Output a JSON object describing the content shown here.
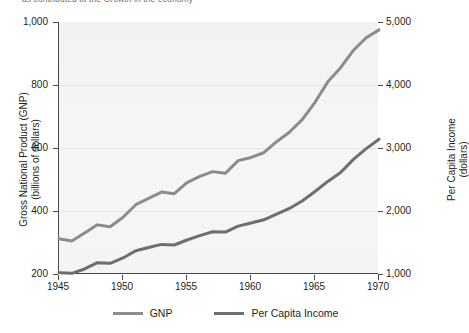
{
  "caption": {
    "text": "as contributed to the Growth in the economy"
  },
  "chart_data": {
    "type": "line",
    "title": "",
    "subtitle": "",
    "xlabel": "",
    "ylabel": "Gross National Product (GNP)\n(billions of dollars)",
    "y2label": "Per Capita Income\n(dollars)",
    "grid": true,
    "legend_position": "bottom",
    "x": [
      1945,
      1946,
      1947,
      1948,
      1949,
      1950,
      1951,
      1952,
      1953,
      1954,
      1955,
      1956,
      1957,
      1958,
      1959,
      1960,
      1961,
      1962,
      1963,
      1964,
      1965,
      1966,
      1967,
      1968,
      1969,
      1970
    ],
    "xlim": [
      1945,
      1970
    ],
    "xticks": [
      1945,
      1950,
      1955,
      1960,
      1965,
      1970
    ],
    "xtick_labels": [
      "1945",
      "1950",
      "1955",
      "1960",
      "1965",
      "1970"
    ],
    "ylim": [
      200,
      1000
    ],
    "yticks": [
      200,
      400,
      600,
      800,
      1000
    ],
    "ytick_labels": [
      "200",
      "400",
      "600",
      "800",
      "1,000"
    ],
    "y2lim": [
      1000,
      5000
    ],
    "y2ticks": [
      1000,
      2000,
      3000,
      4000,
      5000
    ],
    "y2tick_labels": [
      "1,000",
      "2,000",
      "3,000",
      "4,000",
      "5,000"
    ],
    "series": [
      {
        "name": "GNP",
        "axis": "left",
        "color": "#8c8c8c",
        "units": "billions of dollars",
        "values": [
          312,
          305,
          330,
          356,
          350,
          380,
          420,
          440,
          460,
          455,
          490,
          510,
          525,
          520,
          560,
          570,
          585,
          620,
          650,
          690,
          745,
          810,
          855,
          910,
          950,
          975
        ]
      },
      {
        "name": "Per Capita Income",
        "axis": "right",
        "color": "#6e6e6e",
        "units": "dollars",
        "values": [
          1020,
          1010,
          1080,
          1180,
          1170,
          1255,
          1370,
          1420,
          1470,
          1460,
          1540,
          1610,
          1670,
          1665,
          1760,
          1810,
          1860,
          1950,
          2040,
          2160,
          2310,
          2470,
          2610,
          2820,
          2990,
          3140
        ]
      }
    ]
  },
  "axes": {
    "left_title_line1": "Gross National Product (GNP)",
    "left_title_line2": "(billions of dollars)",
    "right_title_line1": "Per Capita Income",
    "right_title_line2": "(dollars)"
  },
  "legend": {
    "items": [
      {
        "label": "GNP",
        "color": "#8c8c8c"
      },
      {
        "label": "Per Capita Income",
        "color": "#6e6e6e"
      }
    ]
  },
  "colors": {
    "axis": "#4a4a4a",
    "plot_background": "#f4f4f4",
    "gridline": "#e6e6e6",
    "text": "#231f20"
  }
}
